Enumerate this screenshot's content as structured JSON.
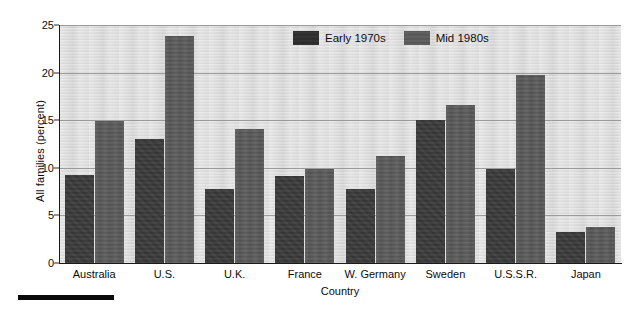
{
  "chart_data": {
    "type": "bar",
    "title": "",
    "xlabel": "Country",
    "ylabel": "All families (percent)",
    "categories": [
      "Australia",
      "U.S.",
      "U.K.",
      "France",
      "W. Germany",
      "Sweden",
      "U.S.S.R.",
      "Japan"
    ],
    "series": [
      {
        "name": "Early 1970s",
        "color": "#3a3a3a",
        "values": [
          9.2,
          13.0,
          7.8,
          9.1,
          7.8,
          15.0,
          9.9,
          3.3
        ]
      },
      {
        "name": "Mid 1980s",
        "color": "#595959",
        "values": [
          14.9,
          23.8,
          14.1,
          9.9,
          11.2,
          16.6,
          19.8,
          3.8
        ]
      }
    ],
    "ylim": [
      0,
      25
    ],
    "yticks": [
      0,
      5,
      10,
      15,
      20,
      25
    ],
    "ytick_labels": [
      "0",
      "5",
      "10",
      "15",
      "20",
      "25"
    ],
    "grid": true,
    "grid_axis": "y",
    "legend_position": "upper center",
    "plot_background": "#d9d9d9"
  },
  "legend": {
    "entries": [
      {
        "label": "Early 1970s"
      },
      {
        "label": "Mid 1980s"
      }
    ]
  }
}
